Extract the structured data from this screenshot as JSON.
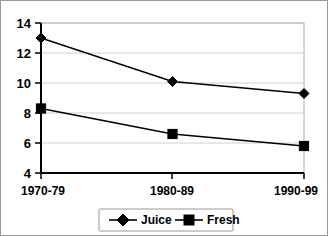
{
  "chart_data": {
    "type": "line",
    "title": "",
    "xlabel": "",
    "ylabel": "",
    "categories": [
      "1970-79",
      "1980-89",
      "1990-99"
    ],
    "ylim": [
      4,
      14
    ],
    "yticks": [
      4,
      6,
      8,
      10,
      12,
      14
    ],
    "grid": true,
    "legend_position": "bottom",
    "series": [
      {
        "name": "Juice",
        "marker": "diamond",
        "color": "#000000",
        "values": [
          13.0,
          10.1,
          9.3
        ]
      },
      {
        "name": "Fresh",
        "marker": "square",
        "color": "#000000",
        "values": [
          8.3,
          6.6,
          5.8
        ]
      }
    ]
  },
  "axis": {
    "y_tick_labels": [
      "14",
      "12",
      "10",
      "8",
      "6",
      "4"
    ],
    "x_tick_labels": [
      "1970-79",
      "1980-89",
      "1990-99"
    ]
  },
  "legend": {
    "items": [
      {
        "label": "Juice",
        "marker": "diamond-marker-icon"
      },
      {
        "label": "Fresh",
        "marker": "square-marker-icon"
      }
    ]
  }
}
